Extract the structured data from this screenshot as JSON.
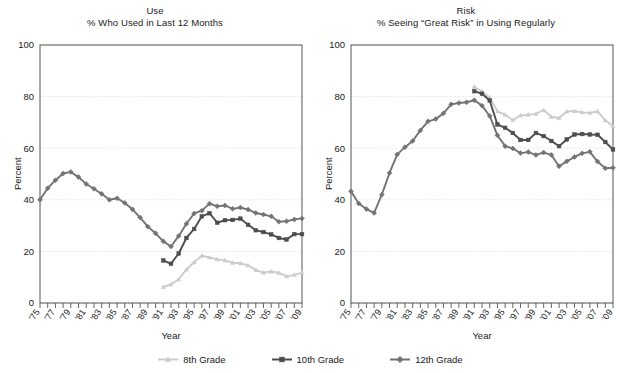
{
  "figure": {
    "y_axis_label": "Percent",
    "x_axis_label": "Year",
    "yticks": [
      0,
      20,
      40,
      60,
      80,
      100
    ],
    "xtick_labels": [
      "'75",
      "'77",
      "'79",
      "'81",
      "'83",
      "'85",
      "'87",
      "'89",
      "'91",
      "'93",
      "'95",
      "'97",
      "'99",
      "'01",
      "'03",
      "'05",
      "'07",
      "'09"
    ],
    "colors": {
      "grade8": "#cccccc",
      "grade10": "#4d4d4d",
      "grade12": "#737373",
      "axis": "#555555",
      "grid": "#cfcfcf",
      "text": "#1a1a1a"
    }
  },
  "legend": {
    "position": "bottom-center",
    "items": [
      {
        "label": "8th Grade",
        "color": "#cccccc",
        "marker": "triangle"
      },
      {
        "label": "10th Grade",
        "color": "#4d4d4d",
        "marker": "square"
      },
      {
        "label": "12th Grade",
        "color": "#737373",
        "marker": "diamond"
      }
    ]
  },
  "panels": {
    "left": {
      "title_line1": "Use",
      "title_line2": "% Who Used in Last 12 Months",
      "y_axis_label": "Percent",
      "x_axis_label": "Year"
    },
    "right": {
      "title_line1": "Risk",
      "title_line2": "% Seeing “Great Risk” in Using Regularly",
      "y_axis_label": "Percent",
      "x_axis_label": "Year"
    }
  },
  "chart_data": [
    {
      "type": "line",
      "panel": "left",
      "title": "Use",
      "subtitle": "% Who Used in Last 12 Months",
      "xlabel": "Year",
      "ylabel": "Percent",
      "ylim": [
        0,
        100
      ],
      "xlim": [
        1975,
        2009
      ],
      "yticks": [
        0,
        20,
        40,
        60,
        80,
        100
      ],
      "grid": true,
      "legend": "bottom",
      "x": [
        1975,
        1976,
        1977,
        1978,
        1979,
        1980,
        1981,
        1982,
        1983,
        1984,
        1985,
        1986,
        1987,
        1988,
        1989,
        1990,
        1991,
        1992,
        1993,
        1994,
        1995,
        1996,
        1997,
        1998,
        1999,
        2000,
        2001,
        2002,
        2003,
        2004,
        2005,
        2006,
        2007,
        2008,
        2009
      ],
      "series": [
        {
          "name": "8th Grade",
          "color": "#cccccc",
          "marker": "triangle",
          "x": [
            1991,
            1992,
            1993,
            1994,
            1995,
            1996,
            1997,
            1998,
            1999,
            2000,
            2001,
            2002,
            2003,
            2004,
            2005,
            2006,
            2007,
            2008,
            2009
          ],
          "values": [
            6.2,
            7.2,
            9.2,
            13.0,
            15.8,
            18.3,
            17.7,
            16.9,
            16.5,
            15.6,
            15.4,
            14.6,
            12.8,
            11.8,
            12.2,
            11.7,
            10.3,
            10.9,
            11.8
          ]
        },
        {
          "name": "10th Grade",
          "color": "#4d4d4d",
          "marker": "square",
          "x": [
            1991,
            1992,
            1993,
            1994,
            1995,
            1996,
            1997,
            1998,
            1999,
            2000,
            2001,
            2002,
            2003,
            2004,
            2005,
            2006,
            2007,
            2008,
            2009
          ],
          "values": [
            16.5,
            15.2,
            19.2,
            25.2,
            28.7,
            33.6,
            34.8,
            31.1,
            32.1,
            32.2,
            32.7,
            30.3,
            28.2,
            27.5,
            26.6,
            25.2,
            24.6,
            26.7,
            26.7
          ]
        },
        {
          "name": "12th Grade",
          "color": "#737373",
          "marker": "diamond",
          "x": [
            1975,
            1976,
            1977,
            1978,
            1979,
            1980,
            1981,
            1982,
            1983,
            1984,
            1985,
            1986,
            1987,
            1988,
            1989,
            1990,
            1991,
            1992,
            1993,
            1994,
            1995,
            1996,
            1997,
            1998,
            1999,
            2000,
            2001,
            2002,
            2003,
            2004,
            2005,
            2006,
            2007,
            2008,
            2009
          ],
          "values": [
            40.0,
            44.5,
            47.6,
            50.2,
            50.8,
            48.8,
            46.1,
            44.3,
            42.3,
            40.0,
            40.6,
            38.8,
            36.3,
            33.1,
            29.6,
            27.0,
            23.9,
            21.9,
            26.0,
            30.7,
            34.7,
            35.8,
            38.5,
            37.5,
            37.8,
            36.5,
            37.0,
            36.2,
            34.9,
            34.3,
            33.6,
            31.5,
            31.7,
            32.4,
            32.8
          ]
        }
      ]
    },
    {
      "type": "line",
      "panel": "right",
      "title": "Risk",
      "subtitle": "% Seeing “Great Risk” in Using Regularly",
      "xlabel": "Year",
      "ylabel": "Percent",
      "ylim": [
        0,
        100
      ],
      "xlim": [
        1975,
        2009
      ],
      "yticks": [
        0,
        20,
        40,
        60,
        80,
        100
      ],
      "grid": true,
      "legend": "bottom",
      "x": [
        1975,
        1976,
        1977,
        1978,
        1979,
        1980,
        1981,
        1982,
        1983,
        1984,
        1985,
        1986,
        1987,
        1988,
        1989,
        1990,
        1991,
        1992,
        1993,
        1994,
        1995,
        1996,
        1997,
        1998,
        1999,
        2000,
        2001,
        2002,
        2003,
        2004,
        2005,
        2006,
        2007,
        2008,
        2009
      ],
      "series": [
        {
          "name": "8th Grade",
          "color": "#cccccc",
          "marker": "triangle",
          "x": [
            1991,
            1992,
            1993,
            1994,
            1995,
            1996,
            1997,
            1998,
            1999,
            2000,
            2001,
            2002,
            2003,
            2004,
            2005,
            2006,
            2007,
            2008,
            2009
          ],
          "values": [
            83.8,
            82.0,
            79.6,
            74.3,
            73.0,
            70.9,
            72.7,
            73.0,
            73.3,
            74.8,
            72.2,
            71.7,
            74.2,
            74.4,
            73.9,
            73.7,
            74.3,
            70.8,
            68.5
          ]
        },
        {
          "name": "10th Grade",
          "color": "#4d4d4d",
          "marker": "square",
          "x": [
            1991,
            1992,
            1993,
            1994,
            1995,
            1996,
            1997,
            1998,
            1999,
            2000,
            2001,
            2002,
            2003,
            2004,
            2005,
            2006,
            2007,
            2008,
            2009
          ],
          "values": [
            82.1,
            81.1,
            78.5,
            69.2,
            67.9,
            65.9,
            63.2,
            63.2,
            65.9,
            64.7,
            62.8,
            60.8,
            63.4,
            65.3,
            65.5,
            65.3,
            65.2,
            62.4,
            59.5
          ]
        },
        {
          "name": "12th Grade",
          "color": "#737373",
          "marker": "diamond",
          "x": [
            1975,
            1976,
            1977,
            1978,
            1979,
            1980,
            1981,
            1982,
            1983,
            1984,
            1985,
            1986,
            1987,
            1988,
            1989,
            1990,
            1991,
            1992,
            1993,
            1994,
            1995,
            1996,
            1997,
            1998,
            1999,
            2000,
            2001,
            2002,
            2003,
            2004,
            2005,
            2006,
            2007,
            2008,
            2009
          ],
          "values": [
            43.3,
            38.6,
            36.4,
            34.9,
            42.0,
            50.4,
            57.6,
            60.4,
            62.8,
            66.9,
            70.4,
            71.3,
            73.5,
            77.0,
            77.5,
            77.8,
            78.6,
            76.5,
            72.5,
            65.0,
            60.8,
            59.9,
            58.1,
            58.5,
            57.4,
            58.3,
            57.4,
            53.0,
            54.9,
            56.6,
            58.0,
            58.6,
            54.8,
            52.2,
            52.4
          ]
        }
      ]
    }
  ]
}
